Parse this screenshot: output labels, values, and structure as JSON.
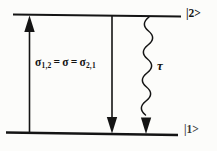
{
  "diagram": {
    "upper_level_label": "|2>",
    "lower_level_label": "|1>",
    "equation": {
      "sigma1": "σ",
      "sub1": "1,2",
      "eq1": "=",
      "sigma2": "σ",
      "eq2": "=",
      "sigma3": "σ",
      "sub3": "2,1"
    },
    "lifetime_label": "τ",
    "colors": {
      "ink": "#141414",
      "background": "#fcfcfa"
    }
  }
}
